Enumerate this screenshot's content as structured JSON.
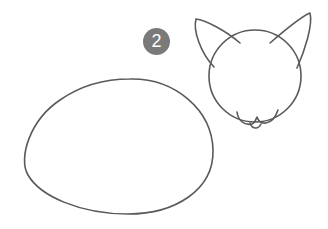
{
  "step": {
    "number": "2"
  },
  "illustration": {
    "subject": "cat sketch step",
    "parts": [
      "body-oval",
      "head-circle",
      "left-ear",
      "right-ear",
      "muzzle"
    ],
    "stroke_color": "#5a5a5a",
    "badge_color": "#7a7a7a"
  }
}
